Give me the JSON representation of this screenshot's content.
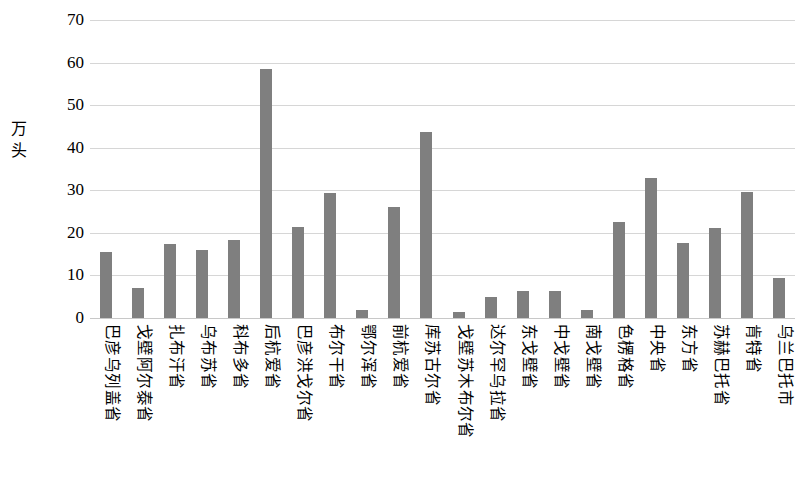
{
  "chart_data": {
    "type": "bar",
    "title": "",
    "subtitle": "",
    "xlabel": "",
    "ylabel": "万头",
    "ylim": [
      0,
      70
    ],
    "y_ticks": [
      0,
      10,
      20,
      30,
      40,
      50,
      60,
      70
    ],
    "grid": true,
    "legend": "none",
    "bar_color": "#7f7f7f",
    "gridline_color": "#d6d6d6",
    "categories": [
      "巴彦乌列盖省",
      "戈壁阿尔泰省",
      "扎布汗省",
      "乌布苏省",
      "科布多省",
      "后杭爱省",
      "巴彦洪戈尔省",
      "布尔干省",
      "鄂尔浑省",
      "前杭爱省",
      "库苏古尔省",
      "戈壁苏木布尔省",
      "达尔罕乌拉省",
      "东戈壁省",
      "中戈壁省",
      "南戈壁省",
      "色楞格省",
      "中央省",
      "东方省",
      "苏赫巴托省",
      "肯特省",
      "乌兰巴托市"
    ],
    "values": [
      15.6,
      7.0,
      17.3,
      16.0,
      18.3,
      58.4,
      21.4,
      29.3,
      2.0,
      26.0,
      43.7,
      1.3,
      4.9,
      6.3,
      6.3,
      2.0,
      22.6,
      32.8,
      17.6,
      21.1,
      29.6,
      9.3
    ]
  }
}
